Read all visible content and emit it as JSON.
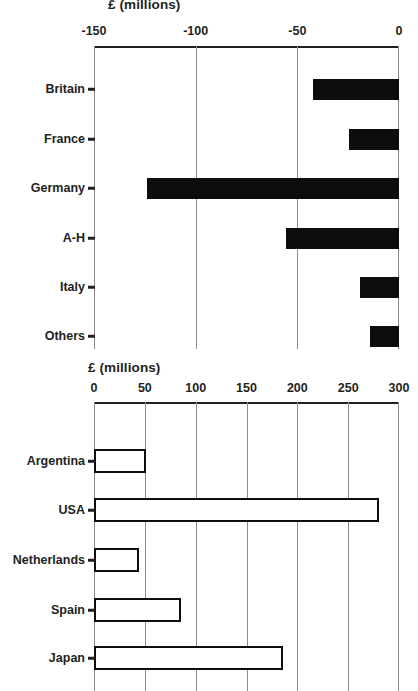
{
  "chart_data": [
    {
      "type": "bar",
      "orientation": "horizontal",
      "title": "",
      "xlabel": "£ (millions)",
      "ylabel": "",
      "categories": [
        "Britain",
        "France",
        "Germany",
        "A-H",
        "Italy",
        "Others"
      ],
      "values": [
        -42.5,
        -24.8,
        -124,
        -55.5,
        -19.3,
        -14.4
      ],
      "xlim": [
        -150,
        0
      ],
      "xticks": [
        -150,
        -100,
        -50,
        0
      ],
      "xtick_labels": [
        "-150",
        "-100",
        "-50",
        "0"
      ],
      "grid": true,
      "axis_position": "top",
      "bar_style": "filled",
      "bar_color": "#0d0d0d",
      "legend": "none"
    },
    {
      "type": "bar",
      "orientation": "horizontal",
      "title": "",
      "xlabel": "£ (millions)",
      "ylabel": "",
      "categories": [
        "Argentina",
        "USA",
        "Netherlands",
        "Spain",
        "Japan"
      ],
      "values": [
        51,
        280,
        44,
        86,
        186
      ],
      "xlim": [
        0,
        300
      ],
      "xticks": [
        0,
        50,
        100,
        150,
        200,
        250,
        300
      ],
      "xtick_labels": [
        "0",
        "50",
        "100",
        "150",
        "200",
        "250",
        "300"
      ],
      "grid": true,
      "axis_position": "top",
      "bar_style": "hollow",
      "bar_color": "#ffffff",
      "bar_outline": "#0d0d0d",
      "legend": "none"
    }
  ],
  "panels": {
    "top": {
      "axis_title": "£ (millions)",
      "tick_labels": [
        "-150",
        "-100",
        "-50",
        "0"
      ],
      "category_labels": [
        "Britain",
        "France",
        "Germany",
        "A-H",
        "Italy",
        "Others"
      ]
    },
    "bottom": {
      "axis_title": "£ (millions)",
      "tick_labels": [
        "0",
        "50",
        "100",
        "150",
        "200",
        "250",
        "300"
      ],
      "category_labels": [
        "Argentina",
        "USA",
        "Netherlands",
        "Spain",
        "Japan"
      ]
    }
  },
  "colors": {
    "bar_fill": "#0d0d0d",
    "grid": "#8d8d8d",
    "axis": "#231f20",
    "background": "#ffffff"
  }
}
